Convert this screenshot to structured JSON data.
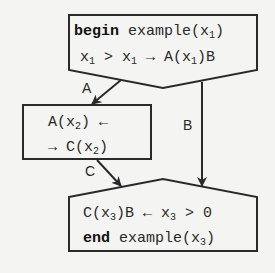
{
  "nodes": {
    "start": {
      "keyword": "begin",
      "line1_rest": " example(x",
      "line1_sub": "1",
      "line1_tail": ")",
      "line2": [
        {
          "t": "x"
        },
        {
          "s": "1"
        },
        {
          "t": " > x"
        },
        {
          "s": "1"
        },
        {
          "t": " → A(x"
        },
        {
          "s": "1"
        },
        {
          "t": ")B"
        }
      ]
    },
    "middle": {
      "line1": [
        {
          "t": "A(x"
        },
        {
          "s": "2"
        },
        {
          "t": ") ←"
        }
      ],
      "line2": [
        {
          "t": "→ C(x"
        },
        {
          "s": "2"
        },
        {
          "t": ")"
        }
      ]
    },
    "end": {
      "line1": [
        {
          "t": "C(x"
        },
        {
          "s": "3"
        },
        {
          "t": ")B ← x"
        },
        {
          "s": "3"
        },
        {
          "t": " > 0"
        }
      ],
      "keyword": "end",
      "line2_rest": " example(x",
      "line2_sub": "3",
      "line2_tail": ")"
    }
  },
  "edges": [
    {
      "label": "A",
      "from": "start",
      "to": "middle"
    },
    {
      "label": "B",
      "from": "start",
      "to": "end"
    },
    {
      "label": "C",
      "from": "middle",
      "to": "end"
    }
  ],
  "colors": {
    "stroke": "#2a2a2a",
    "background": "#f4f4f2"
  }
}
